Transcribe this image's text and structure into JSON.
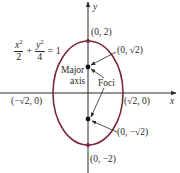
{
  "diagram": {
    "equation": {
      "term1_num": "x",
      "term1_den": "2",
      "plus": "+",
      "term2_num": "y",
      "term2_den": "4",
      "equals": "= 1",
      "exponent": "2"
    },
    "axes": {
      "x_label": "x",
      "y_label": "y"
    },
    "labels": {
      "top_vertex": "(0, 2)",
      "bottom_vertex": "(0, −2)",
      "top_focus": "(0, √2)",
      "bottom_focus": "(0, −√2)",
      "left_covertex": "(−√2, 0)",
      "right_covertex": "(√2, 0)",
      "major_axis_line1": "Major",
      "major_axis_line2": "axis",
      "foci": "Foci"
    },
    "colors": {
      "ellipse": "#7a2a3a",
      "axes": "#2a2a2a",
      "text": "#2a2a2a"
    },
    "geometry": {
      "center": [
        0,
        0
      ],
      "semi_major_y": 2,
      "semi_minor_x": 1.414,
      "foci": [
        [
          0,
          1.414
        ],
        [
          0,
          -1.414
        ]
      ],
      "vertices": [
        [
          0,
          2
        ],
        [
          0,
          -2
        ]
      ],
      "covertices": [
        [
          -1.414,
          0
        ],
        [
          1.414,
          0
        ]
      ]
    }
  }
}
